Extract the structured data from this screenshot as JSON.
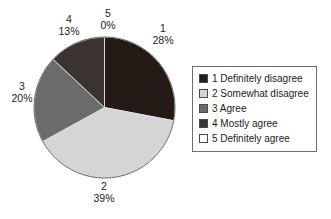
{
  "chart_data": {
    "type": "pie",
    "title": "",
    "labels": [
      "1",
      "2",
      "3",
      "4",
      "5"
    ],
    "values": [
      28,
      39,
      20,
      13,
      0
    ],
    "value_unit": "%",
    "slices": [
      {
        "label": "1",
        "percent_text": "28%",
        "value": 28,
        "color": "#241a16",
        "legend_label": "1 Definitely disagree"
      },
      {
        "label": "2",
        "percent_text": "39%",
        "value": 39,
        "color": "#d5d5d5",
        "legend_label": "2 Somewhat disagree"
      },
      {
        "label": "3",
        "percent_text": "20%",
        "value": 20,
        "color": "#6b6b6b",
        "legend_label": "3 Agree"
      },
      {
        "label": "4",
        "percent_text": "13%",
        "value": 13,
        "color": "#3a332f",
        "legend_label": "4 Mostly agree"
      },
      {
        "label": "5",
        "percent_text": "0%",
        "value": 0,
        "color": "#ffffff",
        "legend_label": "5 Definitely agree"
      }
    ],
    "legend": {
      "position": "right",
      "entries": [
        {
          "label": "1 Definitely disagree",
          "color": "#241a16"
        },
        {
          "label": "2 Somewhat disagree",
          "color": "#d5d5d5"
        },
        {
          "label": "3 Agree",
          "color": "#6b6b6b"
        },
        {
          "label": "4 Mostly agree",
          "color": "#3a332f"
        },
        {
          "label": "5 Definitely agree",
          "color": "#ffffff"
        }
      ]
    },
    "start_angle_deg": 0,
    "direction": "clockwise",
    "grid": false,
    "xlabel": "",
    "ylabel": ""
  },
  "colors": {
    "background": "#ffffff",
    "outline": "#6e6e6e",
    "text": "#1c1c1c"
  }
}
